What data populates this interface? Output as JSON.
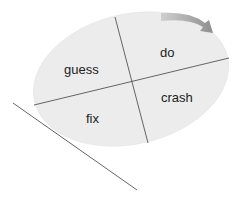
{
  "diagram": {
    "quadrants": {
      "top_left": "guess",
      "top_right": "do",
      "bottom_right": "crash",
      "bottom_left": "fix"
    },
    "arrow_direction": "clockwise",
    "colors": {
      "ellipse_fill": "#ececec",
      "divider": "#555555",
      "arrow": "#9a9a9a",
      "tangent_line": "#555555"
    }
  }
}
